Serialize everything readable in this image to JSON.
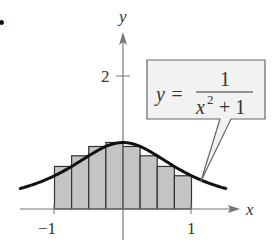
{
  "bullet": "•",
  "labels": {
    "x_axis": "x",
    "y_axis": "y",
    "tick_neg1": "−1",
    "tick_pos1": "1",
    "tick_y2": "2"
  },
  "callout": {
    "lhs": "y =",
    "numerator": "1",
    "denominator_base": "x",
    "denominator_exp": "2",
    "denominator_rest": "+ 1"
  },
  "colors": {
    "bar_fill": "#c4c4c4",
    "bar_stroke": "#333333",
    "curve": "#111111",
    "axis": "#777777",
    "callout_fill": "#f2f2f2",
    "callout_stroke": "#666666"
  },
  "chart_data": {
    "type": "bar",
    "title": "",
    "function": "y = 1/(x^2 + 1)",
    "xlabel": "x",
    "ylabel": "y",
    "xlim": [
      -1.5,
      1.7
    ],
    "ylim": [
      -0.5,
      2.5
    ],
    "x_ticks": [
      -1,
      1
    ],
    "y_ticks": [
      2
    ],
    "grid": false,
    "legend": "none",
    "rectangles": {
      "left_edges": [
        -1,
        -0.75,
        -0.5,
        -0.25,
        0,
        0.25,
        0.5,
        0.75
      ],
      "width": 0.25,
      "heights": [
        0.64,
        0.8,
        0.94,
        1.0,
        0.94,
        0.8,
        0.64,
        0.5
      ]
    },
    "curve_domain": [
      -1.5,
      1.5
    ]
  }
}
